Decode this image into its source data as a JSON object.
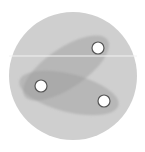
{
  "diagram": {
    "canvas": {
      "width": 145,
      "height": 152,
      "background": "#ffffff"
    },
    "outer_circle": {
      "cx": 73,
      "cy": 76,
      "r": 64,
      "fill": "#cfcfcf"
    },
    "divider_line": {
      "x1": 9,
      "y1": 56,
      "x2": 137,
      "y2": 56,
      "stroke": "#f2f2f2",
      "width": 1
    },
    "ellipses": [
      {
        "id": "upper-ellipse",
        "cx": 66,
        "cy": 68,
        "rx": 50,
        "ry": 20,
        "rotate": -34,
        "fill": "#9a9a9a",
        "opacity": 0.45
      },
      {
        "id": "lower-ellipse",
        "cx": 69,
        "cy": 93,
        "rx": 51,
        "ry": 19,
        "rotate": 14,
        "fill": "#9a9a9a",
        "opacity": 0.45
      }
    ],
    "dots": [
      {
        "id": "dot-top-right",
        "cx": 98,
        "cy": 48,
        "r": 6,
        "fill": "#ffffff",
        "stroke": "#555555"
      },
      {
        "id": "dot-left",
        "cx": 41,
        "cy": 86,
        "r": 6,
        "fill": "#ffffff",
        "stroke": "#555555"
      },
      {
        "id": "dot-bottom-right",
        "cx": 104,
        "cy": 101,
        "r": 6,
        "fill": "#ffffff",
        "stroke": "#555555"
      }
    ]
  }
}
